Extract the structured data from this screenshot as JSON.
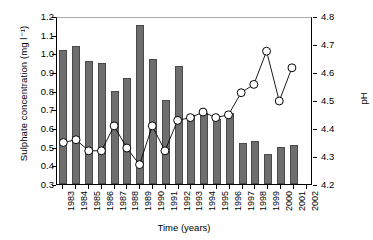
{
  "chart_data": {
    "type": "bar",
    "title": "",
    "xlabel": "Time (years)",
    "ylabel": "Sulphate concentration (mg l⁻¹)",
    "y2label": "pH",
    "grid": false,
    "legend": "none",
    "categories": [
      "1983",
      "1984",
      "1985",
      "1986",
      "1987",
      "1988",
      "1989",
      "1990",
      "1991",
      "1992",
      "1993",
      "1994",
      "1995",
      "1996",
      "1997",
      "1998",
      "1999",
      "2000",
      "2001",
      "2002"
    ],
    "ylim": [
      0.3,
      1.2
    ],
    "yticks": [
      "0.3",
      "0.4",
      "0.5",
      "0.6",
      "0.7",
      "0.8",
      "0.9",
      "1.0",
      "1.1",
      "1.2"
    ],
    "y2lim": [
      4.2,
      4.8
    ],
    "y2ticks": [
      "4.2",
      "4.3",
      "4.4",
      "4.5",
      "4.6",
      "4.7",
      "4.8"
    ],
    "series": [
      {
        "name": "Sulphate concentration",
        "type": "bar",
        "axis": "left",
        "color": "#6e6e6e",
        "edge_color": "#4a4a4a",
        "values": [
          1.02,
          1.04,
          0.96,
          0.95,
          0.8,
          0.87,
          1.15,
          0.97,
          0.75,
          0.93,
          0.67,
          0.68,
          0.65,
          0.68,
          0.52,
          0.53,
          0.46,
          0.5,
          0.51,
          null
        ]
      },
      {
        "name": "pH",
        "type": "line",
        "axis": "right",
        "color": "#000000",
        "marker": "open-circle",
        "marker_face": "#ffffff",
        "values": [
          4.35,
          4.36,
          4.32,
          4.32,
          4.41,
          4.33,
          4.27,
          4.41,
          4.32,
          4.43,
          4.44,
          4.46,
          4.44,
          4.45,
          4.53,
          4.56,
          4.68,
          4.5,
          4.62,
          null
        ]
      }
    ]
  },
  "axes": {
    "left_title": "Sulphate concentration (mg l⁻¹)",
    "right_title": "pH",
    "bottom_title": "Time (years)"
  }
}
